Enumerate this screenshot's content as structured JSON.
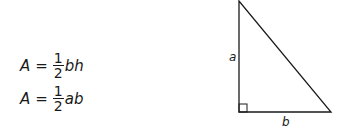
{
  "formulas": [
    {
      "lhs": "A",
      "equals": "=",
      "numerator": "1",
      "denominator": "2",
      "rhs": "bh"
    },
    {
      "lhs": "A",
      "equals": "=",
      "numerator": "1",
      "denominator": "2",
      "rhs": "ab"
    }
  ],
  "triangle": {
    "type": "right-triangle",
    "vertical_side_label": "a",
    "horizontal_side_label": "b",
    "right_angle_marker": true
  }
}
